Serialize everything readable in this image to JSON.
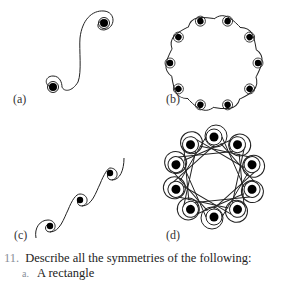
{
  "figures": [
    {
      "id": "a",
      "label": "(a)",
      "description": "S-curve with two spiral ends"
    },
    {
      "id": "b",
      "label": "(b)",
      "description": "ring of ten spirals connected by S-curves"
    },
    {
      "id": "c",
      "label": "(c)",
      "description": "diagonal strip of repeating spirals"
    },
    {
      "id": "d",
      "label": "(d)",
      "description": "ring of ten overlapping looped spirals"
    }
  ],
  "exercise": {
    "number": "11.",
    "prompt": "Describe all the symmetries of the following:",
    "items": [
      {
        "bullet": "a.",
        "text": "A rectangle"
      }
    ]
  },
  "colors": {
    "ink": "#111111",
    "number": "#8a8f9a"
  }
}
